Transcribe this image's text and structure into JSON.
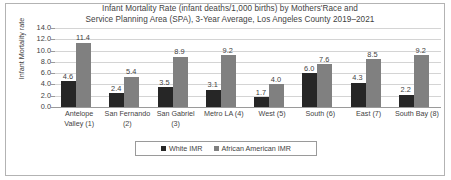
{
  "chart_data": {
    "type": "bar",
    "title": "Infant Mortality Rate (infant deaths/1,000 births) by Mothers'Race and Service Planning Area (SPA), 3-Year Average, Los Angeles County 2019–2021",
    "title_lines": [
      "Infant Mortality Rate (infant deaths/1,000 births) by Mothers'Race and",
      "Service Planning Area (SPA), 3-Year Average, Los Angeles County 2019–2021"
    ],
    "xlabel": "",
    "ylabel": "Infant Mortality rate",
    "ylim": [
      0,
      14
    ],
    "ytick_labels": [
      "14.0",
      "12.0",
      "10.0",
      "8.0",
      "6.0",
      "4.0",
      "2.0",
      "0.0"
    ],
    "ytick_values": [
      14,
      12,
      10,
      8,
      6,
      4,
      2,
      0
    ],
    "grid": true,
    "legend_position": "bottom",
    "categories": [
      "Antelope Valley (1)",
      "San Fernando (2)",
      "San Gabriel (3)",
      "Metro LA (4)",
      "West (5)",
      "South (6)",
      "East (7)",
      "South Bay (8)"
    ],
    "category_lines": [
      [
        "Antelope",
        "Valley (1)"
      ],
      [
        "San Fernando",
        "(2)"
      ],
      [
        "San Gabriel",
        "(3)"
      ],
      [
        "Metro LA (4)",
        ""
      ],
      [
        "West (5)",
        ""
      ],
      [
        "South (6)",
        ""
      ],
      [
        "East (7)",
        ""
      ],
      [
        "South Bay (8)",
        ""
      ]
    ],
    "series": [
      {
        "name": "White IMR",
        "color": "#262626",
        "values": [
          4.6,
          2.4,
          3.5,
          3.1,
          1.7,
          6.0,
          4.3,
          2.2
        ],
        "labels": [
          "4.6",
          "2.4",
          "3.5",
          "3.1",
          "1.7",
          "6.0",
          "4.3",
          "2.2"
        ]
      },
      {
        "name": "African American IMR",
        "color": "#808080",
        "values": [
          11.4,
          5.4,
          8.9,
          9.2,
          4.0,
          7.6,
          8.5,
          9.2
        ],
        "labels": [
          "11.4",
          "5.4",
          "8.9",
          "9.2",
          "4.0",
          "7.6",
          "8.5",
          "9.2"
        ]
      }
    ]
  },
  "legend": {
    "items": [
      {
        "label": "White IMR",
        "color": "#262626"
      },
      {
        "label": "African American IMR",
        "color": "#808080"
      }
    ]
  }
}
